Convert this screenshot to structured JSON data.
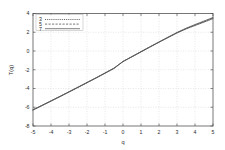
{
  "chart_data": {
    "type": "line",
    "title": "",
    "xlabel": "q",
    "ylabel": "T(q)",
    "xlim": [
      -5,
      5
    ],
    "ylim": [
      -8,
      4
    ],
    "xticks": [
      -5,
      -4,
      -3,
      -2,
      -1,
      0,
      1,
      2,
      3,
      4,
      5
    ],
    "xticklabels": [
      "-5",
      "-4",
      "-3",
      "-2",
      "-1",
      "0",
      "1",
      "2",
      "3",
      "4",
      "5"
    ],
    "yticks": [
      4,
      2,
      0,
      -2,
      -4,
      -6,
      -8
    ],
    "yticklabels": [
      "4",
      "2",
      "0",
      "-2",
      "-4",
      "-6",
      "-8"
    ],
    "grid": true,
    "legend_position": "top-left-inside",
    "x": [
      -5,
      -4.5,
      -4,
      -3.5,
      -3,
      -2.5,
      -2,
      -1.5,
      -1,
      -0.5,
      0,
      0.5,
      1,
      1.5,
      2,
      2.5,
      3,
      3.5,
      4,
      4.5,
      5
    ],
    "series": [
      {
        "name": "3",
        "style": "fine-dash",
        "color": "#3a3a3a",
        "values": [
          -6.3,
          -5.83,
          -5.35,
          -4.87,
          -4.38,
          -3.89,
          -3.39,
          -2.89,
          -2.38,
          -1.86,
          -1.13,
          -0.62,
          -0.1,
          0.42,
          0.93,
          1.43,
          1.92,
          2.35,
          2.72,
          3.08,
          3.45
        ]
      },
      {
        "name": "5",
        "style": "coarse-dash",
        "color": "#4a4a4a",
        "values": [
          -6.28,
          -5.81,
          -5.33,
          -4.85,
          -4.36,
          -3.87,
          -3.37,
          -2.87,
          -2.36,
          -1.84,
          -1.12,
          -0.6,
          -0.08,
          0.44,
          0.95,
          1.45,
          1.95,
          2.39,
          2.77,
          3.14,
          3.52
        ]
      },
      {
        "name": "7",
        "style": "solid",
        "color": "#555555",
        "values": [
          -6.26,
          -5.79,
          -5.31,
          -4.83,
          -4.34,
          -3.85,
          -3.35,
          -2.85,
          -2.34,
          -1.82,
          -1.11,
          -0.59,
          -0.06,
          0.46,
          0.97,
          1.48,
          1.98,
          2.43,
          2.82,
          3.2,
          3.58
        ]
      }
    ]
  },
  "legend": {
    "entries": [
      {
        "label": "3"
      },
      {
        "label": "5"
      },
      {
        "label": "7"
      }
    ]
  }
}
